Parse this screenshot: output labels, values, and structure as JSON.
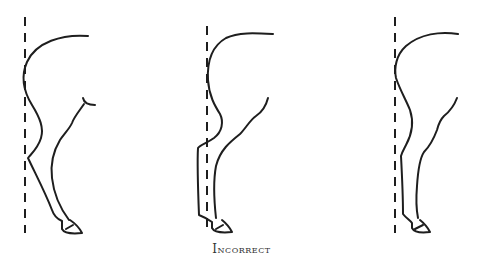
{
  "caption": "Incorrect",
  "colors": {
    "line": "#1e1e1e",
    "background": "#ffffff",
    "caption": "#333333"
  },
  "figures": [
    {
      "id": "leg-1",
      "description": "Hind leg positioned behind plumb line (camped out)"
    },
    {
      "id": "leg-2",
      "description": "Hind leg with hock and cannon in front of plumb line (sickle/under)"
    },
    {
      "id": "leg-3",
      "description": "Hind leg with cannon behind plumb line"
    }
  ]
}
